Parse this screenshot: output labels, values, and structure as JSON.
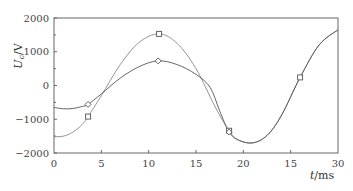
{
  "chart_data": {
    "type": "line",
    "title": "",
    "xlabel": "t/ms",
    "ylabel": "U_c/V",
    "xlim": [
      0,
      30
    ],
    "ylim": [
      -2000,
      2000
    ],
    "x_ticks": [
      0,
      5,
      10,
      15,
      20,
      25,
      30
    ],
    "x_tick_labels": [
      "0",
      "5",
      "10",
      "15",
      "20",
      "15",
      "30"
    ],
    "y_ticks": [
      2000,
      1000,
      0,
      -1000,
      -2000
    ],
    "y_tick_labels": [
      "2000",
      "1000",
      "0",
      "−1000",
      "−2000"
    ],
    "grid": false,
    "legend": null,
    "series": [
      {
        "name": "square-marker curve",
        "marker": "square",
        "color": "#888888",
        "x": [
          0,
          1,
          2,
          3,
          3.6,
          5,
          7,
          9,
          11.1,
          13,
          15,
          17,
          18.5,
          19.5,
          21,
          22.5,
          24,
          26,
          28,
          30
        ],
        "values": [
          -1520,
          -1500,
          -1380,
          -1150,
          -920,
          -300,
          620,
          1280,
          1530,
          1250,
          500,
          -620,
          -1340,
          -1620,
          -1700,
          -1480,
          -900,
          240,
          1200,
          1650
        ],
        "marker_points": [
          [
            3.6,
            -920
          ],
          [
            11.1,
            1530
          ],
          [
            18.5,
            -1340
          ],
          [
            26.0,
            240
          ]
        ]
      },
      {
        "name": "diamond-marker curve",
        "marker": "diamond",
        "color": "#555555",
        "x": [
          0,
          1,
          2,
          3,
          3.6,
          5,
          7,
          9,
          11.0,
          13,
          15,
          16.5,
          17.5,
          18.5,
          19.5,
          21,
          22.5,
          24,
          26,
          28,
          30
        ],
        "values": [
          -650,
          -690,
          -680,
          -620,
          -560,
          -250,
          220,
          560,
          730,
          620,
          330,
          -60,
          -750,
          -1380,
          -1620,
          -1700,
          -1480,
          -900,
          240,
          1200,
          1650
        ],
        "marker_points": [
          [
            3.6,
            -560
          ],
          [
            11.0,
            730
          ],
          [
            18.5,
            -1380
          ]
        ]
      }
    ]
  }
}
